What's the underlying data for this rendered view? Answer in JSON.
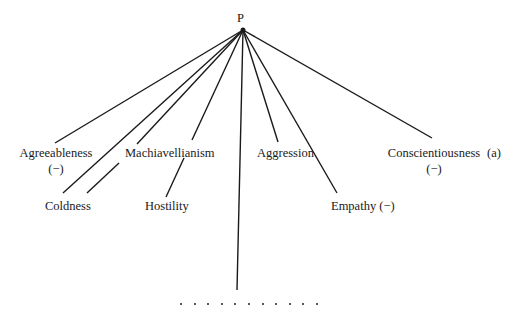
{
  "diagram": {
    "apex_label": "P",
    "figure_tag": "(a)",
    "nodes": [
      {
        "id": "agreeableness",
        "label": "Agreeableness",
        "sub": "(−)"
      },
      {
        "id": "machiavellianism",
        "label": "Machiavellianism"
      },
      {
        "id": "aggression",
        "label": "Aggression"
      },
      {
        "id": "conscientiousness",
        "label": "Conscientiousness",
        "sub": "(−)"
      },
      {
        "id": "coldness",
        "label": "Coldness"
      },
      {
        "id": "hostility",
        "label": "Hostility"
      },
      {
        "id": "empathy",
        "label": "Empathy (−)"
      }
    ],
    "ellipsis_dots": 11,
    "line_color": "#1a1a1a"
  }
}
